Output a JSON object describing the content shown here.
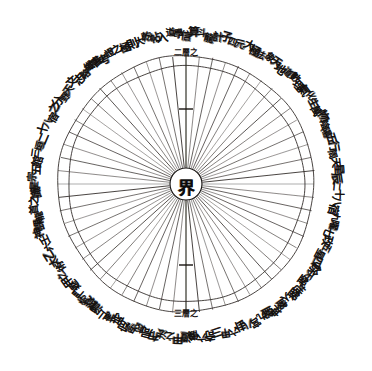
{
  "figure": {
    "kind": "radial-cosmological-diagram",
    "title": "",
    "background_color": "#ffffff",
    "ink_color": "#1a1614",
    "center": {
      "x": 186,
      "y": 184
    },
    "hub": {
      "label": "界",
      "romanization": "jie",
      "radius_px": 16
    },
    "rings": [
      {
        "name": "hub-circle",
        "radius_px": 16,
        "stroke": "#151210",
        "width": 1.2
      },
      {
        "name": "inner-rim-circle",
        "radius_px": 118,
        "stroke": "#2a2522",
        "width": 1.0
      },
      {
        "name": "outer-rim-circle",
        "radius_px": 128,
        "stroke": "#2a2522",
        "width": 1.0
      },
      {
        "name": "text-band-circle",
        "radius_px": 152,
        "stroke": "none",
        "width": 0
      }
    ],
    "spokes": {
      "count": 60,
      "inner_radius_px": 17,
      "outer_radius_px": 128,
      "stroke": "#2d2724"
    },
    "axis_marks": [
      {
        "name": "upper-tick",
        "x": 186,
        "y": 109,
        "width_px": 14,
        "orientation": "horizontal"
      },
      {
        "name": "lower-tick",
        "x": 186,
        "y": 265,
        "width_px": 14,
        "orientation": "horizontal"
      }
    ],
    "inner_labels": [
      {
        "name": "top-inner-label",
        "text": "二層之",
        "x": 186,
        "y": 53,
        "rotation_deg": 0
      },
      {
        "name": "bottom-inner-label",
        "text": "三層之",
        "x": 186,
        "y": 314,
        "rotation_deg": 0
      }
    ],
    "rim_text": {
      "description": "Handwritten Chinese annotation running clockwise around the outer rim",
      "radius_px": 152,
      "start_angle_deg": -108,
      "characters": [
        "大",
        "乾",
        "帖",
        "入",
        "道",
        "學",
        "信",
        "算",
        "斗",
        "龍",
        "計",
        "子",
        "四",
        "元",
        "大",
        "極",
        "法",
        "象",
        "天",
        "地",
        "道",
        "數",
        "理",
        "氣",
        "化",
        "生",
        "萬",
        "物",
        "陰",
        "陽",
        "五",
        "行",
        "周",
        "天",
        "星",
        "辰",
        "二",
        "十",
        "八",
        "宿",
        "九",
        "曜",
        "七",
        "政",
        "五",
        "星",
        "四",
        "餘",
        "天",
        "盤",
        "地",
        "盤",
        "人",
        "盤",
        "神",
        "盤",
        "九",
        "宮",
        "八",
        "卦",
        "六",
        "甲",
        "三",
        "奇",
        "六",
        "儀",
        "遁",
        "甲",
        "之",
        "法",
        "布",
        "局",
        "起",
        "例",
        "定",
        "時",
        "掩",
        "山",
        "潛",
        "蹤",
        "奇",
        "門",
        "遯",
        "甲",
        "之",
        "術",
        "太",
        "乙",
        "六",
        "壬",
        "神",
        "課",
        "龍",
        "首",
        "之",
        "識",
        "星",
        "宗",
        "五",
        "館",
        "三",
        "垣",
        "二",
        "十",
        "八",
        "宿",
        "之",
        "分",
        "野",
        "天",
        "文",
        "志",
        "略",
        "纖",
        "書",
        "考",
        "證",
        "之",
        "極",
        "則"
      ]
    }
  }
}
